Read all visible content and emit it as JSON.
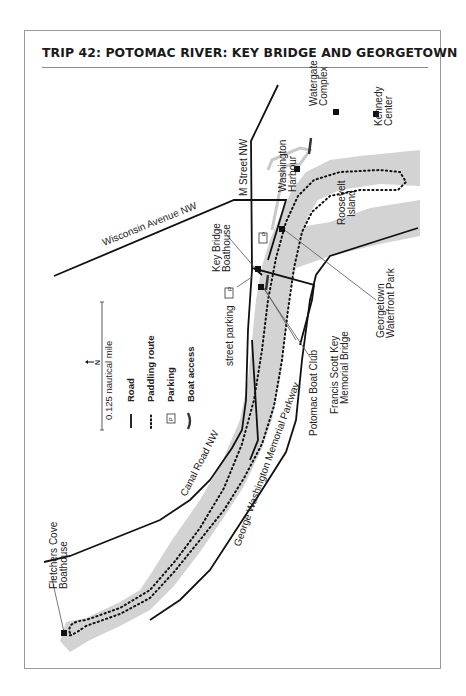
{
  "title": "TRIP 42: POTOMAC RIVER: KEY BRIDGE AND GEORGETOWN",
  "orientation": "rotated 90° counter-clockwise; north points left",
  "colors": {
    "water": "#d3d3d3",
    "road": "#111111",
    "route": "#111111",
    "leader": "#555555",
    "frame": "#9a9a9a"
  },
  "roads": {
    "m_street": "M Street NW",
    "wisconsin": "Wisconsin Avenue NW",
    "canal_road": "Canal Road NW",
    "gw_parkway": "George Washington Memorial Parkway"
  },
  "places": {
    "watergate": [
      "Watergate",
      "Complex"
    ],
    "kennedy": [
      "Kennedy",
      "Center"
    ],
    "washington_harbour": [
      "Washington",
      "Harbour"
    ],
    "roosevelt_island": [
      "Roosevelt",
      "Island"
    ],
    "key_bridge_boathouse": [
      "Key Bridge",
      "Boathouse"
    ],
    "street_parking": "street parking",
    "georgetown_waterfront": [
      "Georgetown",
      "Waterfront Park"
    ],
    "key_bridge": [
      "Francis Scott Key",
      "Memorial Bridge"
    ],
    "potomac_boat_club": "Potomac Boat Club",
    "fletchers": [
      "Fletchers Cove",
      "Boathouse"
    ]
  },
  "legend": {
    "north_label": "N",
    "scale_label": "0.125 nautical mile",
    "items": [
      {
        "symbol": "solid-line",
        "label": "Road"
      },
      {
        "symbol": "dotted-line",
        "label": "Paddling route"
      },
      {
        "symbol": "P-box",
        "label": "Parking"
      },
      {
        "symbol": "bracket",
        "label": "Boat access"
      }
    ],
    "parking_glyph": "P"
  }
}
